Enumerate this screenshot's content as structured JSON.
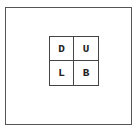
{
  "diagram": {
    "type": "2x2 grid of labeled faces",
    "cells": [
      {
        "label": "D",
        "row": 0,
        "col": 0
      },
      {
        "label": "U",
        "row": 0,
        "col": 1
      },
      {
        "label": "L",
        "row": 1,
        "col": 0
      },
      {
        "label": "B",
        "row": 1,
        "col": 1
      }
    ]
  },
  "colors": {
    "background": "#ffffff",
    "line": "#444444",
    "text": "#222222"
  }
}
